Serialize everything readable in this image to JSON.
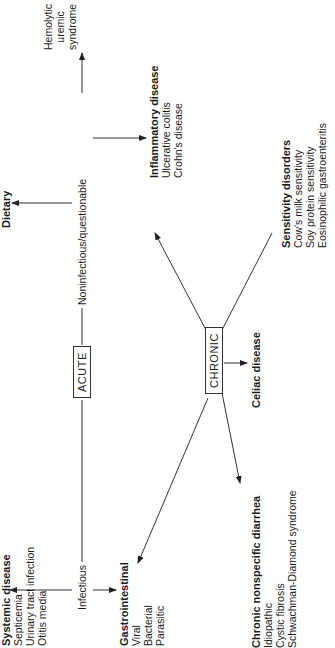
{
  "diagram": {
    "root_boxes": {
      "acute": "ACUTE",
      "chronic": "CHRONIC"
    },
    "branch_labels": {
      "infectious": "Infectious",
      "noninfectious": "Noninfectious/questionable"
    },
    "acute_nodes": {
      "systemic": {
        "title": "Systemic disease",
        "items": [
          "Septicemia",
          "Urinary tract infection",
          "Otitis media"
        ]
      },
      "gastrointestinal": {
        "title": "Gastrointestinal",
        "items": [
          "Viral",
          "Bacterial",
          "Parasitic"
        ]
      },
      "dietary": {
        "title": "Dietary"
      },
      "hus": {
        "lines": [
          "Hemolytic",
          "uremic",
          "syndrome"
        ]
      }
    },
    "chronic_nodes": {
      "nonspecific": {
        "title": "Chronic nonspecific diarrhea",
        "items": [
          "Idiopathic",
          "Cystic fibrosis",
          "Schwachman-Diamond syndrome"
        ]
      },
      "celiac": {
        "title": "Celiac disease"
      },
      "inflammatory": {
        "title": "Inflammatory disease",
        "items": [
          "Ulcerative colitis",
          "Crohn's disease"
        ]
      },
      "sensitivity": {
        "title": "Sensitivity disorders",
        "items": [
          "Cow's milk sensitivity",
          "Soy protein sensitivity",
          "Eosinophilic gastroenteritis"
        ]
      }
    }
  }
}
